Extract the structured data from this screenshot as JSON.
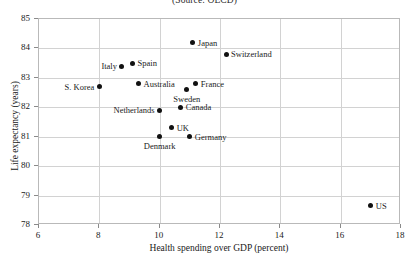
{
  "chart_data": {
    "type": "scatter",
    "title": "",
    "subtitle": "(Source: OECD)",
    "xlabel": "Health spending over GDP (percent)",
    "ylabel": "Life expectancy (years)",
    "xlim": [
      6,
      18
    ],
    "ylim": [
      78,
      85
    ],
    "xticks": [
      6,
      8,
      10,
      12,
      14,
      16,
      18
    ],
    "yticks": [
      78,
      79,
      80,
      81,
      82,
      83,
      84,
      85
    ],
    "grid": true,
    "legend": "none",
    "marker_color": "#111111",
    "grid_color": "#d2d2d2",
    "frame_color": "#b9b9b9",
    "points": [
      {
        "label": "Japan",
        "x": 11.1,
        "y": 84.2,
        "label_pos": "right"
      },
      {
        "label": "Switzerland",
        "x": 12.2,
        "y": 83.8,
        "label_pos": "right"
      },
      {
        "label": "Italy",
        "x": 8.75,
        "y": 83.4,
        "label_pos": "left"
      },
      {
        "label": "Spain",
        "x": 9.1,
        "y": 83.5,
        "label_pos": "right"
      },
      {
        "label": "S. Korea",
        "x": 8.0,
        "y": 82.7,
        "label_pos": "left"
      },
      {
        "label": "Australia",
        "x": 9.3,
        "y": 82.8,
        "label_pos": "right"
      },
      {
        "label": "France",
        "x": 11.2,
        "y": 82.8,
        "label_pos": "right"
      },
      {
        "label": "Sweden",
        "x": 10.9,
        "y": 82.6,
        "label_pos": "below"
      },
      {
        "label": "Netherlands",
        "x": 10.0,
        "y": 81.9,
        "label_pos": "left"
      },
      {
        "label": "Canada",
        "x": 10.7,
        "y": 82.0,
        "label_pos": "right"
      },
      {
        "label": "UK",
        "x": 10.4,
        "y": 81.3,
        "label_pos": "right"
      },
      {
        "label": "Denmark",
        "x": 10.0,
        "y": 81.0,
        "label_pos": "below"
      },
      {
        "label": "Germany",
        "x": 11.0,
        "y": 81.0,
        "label_pos": "right"
      },
      {
        "label": "US",
        "x": 17.0,
        "y": 78.65,
        "label_pos": "right"
      }
    ]
  }
}
